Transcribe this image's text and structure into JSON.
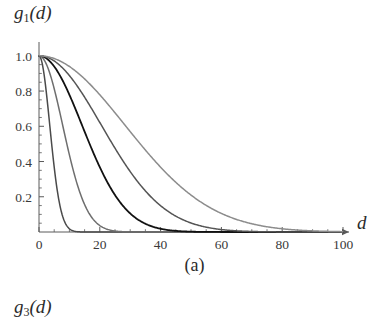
{
  "figure": {
    "panel_caption": "(a)",
    "y_axis_label_base": "g",
    "y_axis_label_sub": "1",
    "y_axis_label_arg": "(d)",
    "x_axis_label": "d",
    "next_panel_label_base": "g",
    "next_panel_label_sub": "3",
    "next_panel_label_arg": "(d)"
  },
  "chart_data": {
    "type": "line",
    "title": "",
    "subtitle": "",
    "xlabel": "d",
    "ylabel": "g_1(d)",
    "caption": "(a)",
    "xlim": [
      0,
      100
    ],
    "ylim": [
      0,
      1.05
    ],
    "grid": false,
    "legend": "none",
    "axis_style": "arrow-terminated",
    "x_ticks": [
      0,
      20,
      40,
      60,
      80,
      100
    ],
    "x_tick_labels": [
      "0",
      "20",
      "40",
      "60",
      "80",
      "100"
    ],
    "x_minor_ticks": [
      5,
      10,
      15,
      25,
      30,
      35,
      45,
      50,
      55,
      65,
      70,
      75,
      85,
      90,
      95
    ],
    "y_ticks": [
      0.2,
      0.4,
      0.6,
      0.8,
      1.0
    ],
    "y_tick_labels": [
      "0.2",
      "0.4",
      "0.6",
      "0.8",
      "1.0"
    ],
    "y_minor_ticks": [
      0.05,
      0.1,
      0.15,
      0.25,
      0.3,
      0.35,
      0.45,
      0.5,
      0.55,
      0.65,
      0.7,
      0.75,
      0.85,
      0.9,
      0.95
    ],
    "x": [
      0,
      2,
      4,
      6,
      8,
      10,
      12,
      14,
      16,
      18,
      20,
      25,
      30,
      35,
      40,
      45,
      50,
      55,
      60,
      65,
      70,
      75,
      80,
      85,
      90,
      95,
      100
    ],
    "series": [
      {
        "name": "curve-1",
        "sigma": 5,
        "color": "#4a4a4a",
        "width": 1.5,
        "values": [
          1.0,
          0.852,
          0.527,
          0.237,
          0.078,
          0.018,
          0.003,
          0.0004,
          0.0,
          0.0,
          0.0,
          0.0,
          0.0,
          0.0,
          0.0,
          0.0,
          0.0,
          0.0,
          0.0,
          0.0,
          0.0,
          0.0,
          0.0,
          0.0,
          0.0,
          0.0,
          0.0
        ]
      },
      {
        "name": "curve-2",
        "sigma": 11,
        "color": "#6e6e6e",
        "width": 1.5,
        "values": [
          1.0,
          0.967,
          0.876,
          0.744,
          0.591,
          0.438,
          0.303,
          0.196,
          0.118,
          0.066,
          0.035,
          0.005,
          0.0005,
          0.0,
          0.0,
          0.0,
          0.0,
          0.0,
          0.0,
          0.0,
          0.0,
          0.0,
          0.0,
          0.0,
          0.0,
          0.0,
          0.0
        ]
      },
      {
        "name": "curve-3",
        "sigma": 20,
        "color": "#111111",
        "width": 1.8,
        "values": [
          1.0,
          0.99,
          0.96,
          0.914,
          0.852,
          0.779,
          0.698,
          0.613,
          0.527,
          0.445,
          0.368,
          0.21,
          0.105,
          0.046,
          0.018,
          0.006,
          0.002,
          0.0004,
          0.0001,
          0.0,
          0.0,
          0.0,
          0.0,
          0.0,
          0.0,
          0.0,
          0.0
        ]
      },
      {
        "name": "curve-4",
        "sigma": 29,
        "color": "#555555",
        "width": 1.5,
        "values": [
          1.0,
          0.995,
          0.981,
          0.958,
          0.926,
          0.886,
          0.84,
          0.789,
          0.734,
          0.676,
          0.617,
          0.468,
          0.337,
          0.231,
          0.15,
          0.092,
          0.053,
          0.029,
          0.015,
          0.007,
          0.003,
          0.001,
          0.0004,
          0.0001,
          0.0,
          0.0,
          0.0
        ]
      },
      {
        "name": "curve-5",
        "sigma": 40,
        "color": "#8c8c8c",
        "width": 1.5,
        "values": [
          1.0,
          0.997,
          0.99,
          0.978,
          0.961,
          0.939,
          0.914,
          0.885,
          0.852,
          0.817,
          0.779,
          0.677,
          0.57,
          0.464,
          0.368,
          0.282,
          0.21,
          0.151,
          0.105,
          0.071,
          0.046,
          0.03,
          0.018,
          0.011,
          0.006,
          0.003,
          0.002
        ]
      }
    ]
  }
}
